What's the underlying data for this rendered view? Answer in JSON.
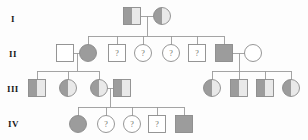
{
  "diagram": {
    "type": "pedigree-chart",
    "title": "",
    "colors": {
      "stroke": "#8a8a8a",
      "line": "#9a9a9a",
      "fill_empty": "#ffffff",
      "fill_shaded": "#9c9c9c",
      "fill_light": "#e9e9e9",
      "text": "#1a1a1a",
      "qmark": "#6b6b6b",
      "background": "#fdfdfd"
    },
    "generation_labels": [
      {
        "label": "I",
        "x": 11,
        "y": 22
      },
      {
        "label": "II",
        "x": 9,
        "y": 57
      },
      {
        "label": "III",
        "x": 7,
        "y": 92
      },
      {
        "label": "IV",
        "x": 8,
        "y": 127
      }
    ],
    "legend_keys": {
      "unknown_marker": "?",
      "fully_shaded": "affected",
      "half_shaded": "carrier",
      "unshaded": "unaffected"
    },
    "individuals": [
      {
        "id": "I-1",
        "gen": "I",
        "shape": "square",
        "fill": "left-shaded",
        "label": "",
        "cx": 132,
        "cy": 16
      },
      {
        "id": "I-2",
        "gen": "I",
        "shape": "circle",
        "fill": "left-shaded",
        "label": "",
        "cx": 162,
        "cy": 16
      },
      {
        "id": "II-1",
        "gen": "II",
        "shape": "square",
        "fill": "unshaded",
        "label": "",
        "cx": 65,
        "cy": 53
      },
      {
        "id": "II-2",
        "gen": "II",
        "shape": "circle",
        "fill": "full-shaded",
        "label": "",
        "cx": 88,
        "cy": 53
      },
      {
        "id": "II-3",
        "gen": "II",
        "shape": "square",
        "fill": "unshaded",
        "label": "?",
        "cx": 117,
        "cy": 53
      },
      {
        "id": "II-4",
        "gen": "II",
        "shape": "circle",
        "fill": "unshaded",
        "label": "?",
        "cx": 143,
        "cy": 53
      },
      {
        "id": "II-5",
        "gen": "II",
        "shape": "circle",
        "fill": "unshaded",
        "label": "?",
        "cx": 171,
        "cy": 53
      },
      {
        "id": "II-6",
        "gen": "II",
        "shape": "square",
        "fill": "unshaded",
        "label": "?",
        "cx": 197,
        "cy": 53
      },
      {
        "id": "II-7",
        "gen": "II",
        "shape": "square",
        "fill": "full-shaded",
        "label": "",
        "cx": 224,
        "cy": 53
      },
      {
        "id": "II-8",
        "gen": "II",
        "shape": "circle",
        "fill": "unshaded",
        "label": "",
        "cx": 253,
        "cy": 53
      },
      {
        "id": "III-1",
        "gen": "III",
        "shape": "square",
        "fill": "left-shaded",
        "label": "",
        "cx": 37,
        "cy": 88
      },
      {
        "id": "III-2",
        "gen": "III",
        "shape": "circle",
        "fill": "left-shaded",
        "label": "",
        "cx": 68,
        "cy": 88
      },
      {
        "id": "III-3",
        "gen": "III",
        "shape": "circle",
        "fill": "left-shaded",
        "label": "",
        "cx": 99,
        "cy": 88
      },
      {
        "id": "III-4",
        "gen": "III",
        "shape": "square",
        "fill": "left-shaded",
        "label": "",
        "cx": 122,
        "cy": 88
      },
      {
        "id": "III-5",
        "gen": "III",
        "shape": "circle",
        "fill": "left-shaded",
        "label": "",
        "cx": 212,
        "cy": 88
      },
      {
        "id": "III-6",
        "gen": "III",
        "shape": "square",
        "fill": "left-shaded",
        "label": "",
        "cx": 239,
        "cy": 88
      },
      {
        "id": "III-7",
        "gen": "III",
        "shape": "square",
        "fill": "left-shaded",
        "label": "",
        "cx": 265,
        "cy": 88
      },
      {
        "id": "III-8",
        "gen": "III",
        "shape": "circle",
        "fill": "left-shaded",
        "label": "",
        "cx": 291,
        "cy": 88
      },
      {
        "id": "IV-1",
        "gen": "IV",
        "shape": "circle",
        "fill": "full-shaded",
        "label": "",
        "cx": 78,
        "cy": 124
      },
      {
        "id": "IV-2",
        "gen": "IV",
        "shape": "circle",
        "fill": "unshaded",
        "label": "?",
        "cx": 106,
        "cy": 124
      },
      {
        "id": "IV-3",
        "gen": "IV",
        "shape": "circle",
        "fill": "unshaded",
        "label": "?",
        "cx": 132,
        "cy": 124
      },
      {
        "id": "IV-4",
        "gen": "IV",
        "shape": "square",
        "fill": "unshaded",
        "label": "?",
        "cx": 157,
        "cy": 124
      },
      {
        "id": "IV-5",
        "gen": "IV",
        "shape": "square",
        "fill": "full-shaded",
        "label": "",
        "cx": 184,
        "cy": 124
      }
    ],
    "mating_lines": [
      {
        "id": "mate-I-1-I-2",
        "x1": 141,
        "y1": 16,
        "x2": 154,
        "y2": 16
      },
      {
        "id": "mate-II-1-II-2",
        "x1": 73,
        "y1": 53,
        "x2": 81,
        "y2": 53
      },
      {
        "id": "mate-II-7-II-8",
        "x1": 232,
        "y1": 53,
        "x2": 246,
        "y2": 53
      },
      {
        "id": "mate-III-3-III-4",
        "x1": 106,
        "y1": 88,
        "x2": 115,
        "y2": 88
      }
    ],
    "descent_lines": [
      {
        "id": "descent-gen1",
        "drop_x": 147,
        "drop_y1": 16,
        "drop_y2": 36,
        "sib_y": 36,
        "sib_x1": 88,
        "sib_x2": 224,
        "children_x": [
          88,
          117,
          143,
          171,
          197,
          224
        ],
        "child_y2": 45
      },
      {
        "id": "descent-gen2-left",
        "drop_x": 77,
        "drop_y1": 53,
        "drop_y2": 71,
        "sib_y": 71,
        "sib_x1": 37,
        "sib_x2": 99,
        "children_x": [
          37,
          68,
          99
        ],
        "child_y2": 80
      },
      {
        "id": "descent-gen2-right",
        "drop_x": 239,
        "drop_y1": 53,
        "drop_y2": 71,
        "sib_y": 71,
        "sib_x1": 212,
        "sib_x2": 291,
        "children_x": [
          212,
          239,
          265,
          291
        ],
        "child_y2": 80
      },
      {
        "id": "descent-gen3",
        "drop_x": 110,
        "drop_y1": 88,
        "drop_y2": 107,
        "sib_y": 107,
        "sib_x1": 78,
        "sib_x2": 184,
        "children_x": [
          78,
          106,
          132,
          157,
          184
        ],
        "child_y2": 116
      }
    ]
  }
}
